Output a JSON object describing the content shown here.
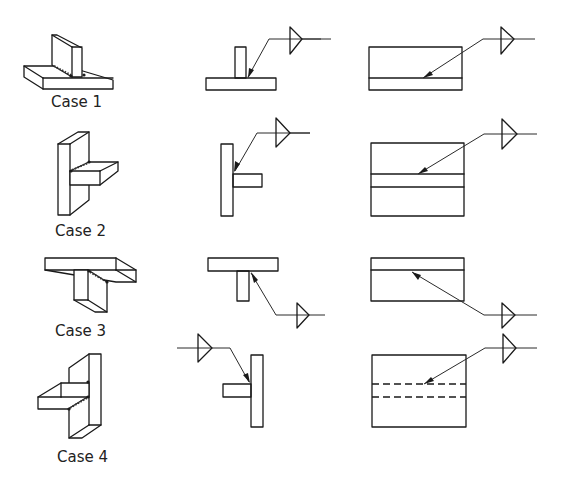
{
  "diagram": {
    "columns": [
      "isometric-view",
      "side-view",
      "front-view"
    ],
    "cases": [
      {
        "label": "Case 1",
        "orientation": "vertical stem on horizontal base",
        "weld_line_in_front_view": "solid"
      },
      {
        "label": "Case 2",
        "orientation": "horizontal stem off vertical plate (right)",
        "weld_line_in_front_view": "solid"
      },
      {
        "label": "Case 3",
        "orientation": "stem hanging below horizontal top plate",
        "weld_line_in_front_view": "solid"
      },
      {
        "label": "Case 4",
        "orientation": "horizontal stem off vertical plate (left)",
        "weld_line_in_front_view": "dashed"
      }
    ],
    "colors": {
      "line": "#1a1a1a",
      "background": "#ffffff"
    }
  }
}
